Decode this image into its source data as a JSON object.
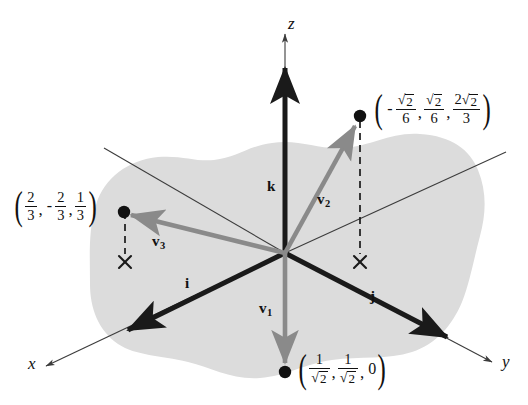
{
  "figure": {
    "type": "vector-diagram-3d",
    "background_color": "#ffffff",
    "plane_fill": "#dcdcdc",
    "basis_vector_color": "#1a1a1a",
    "vector_color": "#8a8a8a",
    "axis_color": "#3c3c3c"
  },
  "axes": [
    {
      "name": "z-axis",
      "label": "z",
      "direction": "up"
    },
    {
      "name": "x-axis",
      "label": "x",
      "direction": "lower-left"
    },
    {
      "name": "y-axis",
      "label": "y",
      "direction": "lower-right"
    }
  ],
  "basis_vectors": [
    {
      "name": "k",
      "label": "k",
      "direction": "up"
    },
    {
      "name": "i",
      "label": "i",
      "direction": "lower-left"
    },
    {
      "name": "j",
      "label": "j",
      "direction": "lower-right"
    }
  ],
  "vectors": [
    {
      "name": "v1",
      "label": "v",
      "subscript": "1",
      "direction": "down",
      "coordinates": {
        "x": "1/√2",
        "y": "1/√2",
        "z": "0"
      }
    },
    {
      "name": "v2",
      "label": "v",
      "subscript": "2",
      "direction": "upper-right",
      "coordinates": {
        "x": "-√2/6",
        "y": "√2/6",
        "z": "2√2/3"
      }
    },
    {
      "name": "v3",
      "label": "v",
      "subscript": "3",
      "direction": "left",
      "coordinates": {
        "x": "2/3",
        "y": "-2/3",
        "z": "1/3"
      }
    }
  ],
  "coordinate_labels": {
    "upper_right": {
      "name": "v2-coordinate-label",
      "components": [
        {
          "sign": "-",
          "numerator": "√2",
          "denominator": "6"
        },
        {
          "sign": "",
          "numerator": "√2",
          "denominator": "6"
        },
        {
          "sign": "",
          "numerator": "2√2",
          "denominator": "3"
        }
      ]
    },
    "left": {
      "name": "v3-coordinate-label",
      "components": [
        {
          "sign": "",
          "numerator": "2",
          "denominator": "3"
        },
        {
          "sign": "-",
          "numerator": "2",
          "denominator": "3"
        },
        {
          "sign": "",
          "numerator": "1",
          "denominator": "3"
        }
      ]
    },
    "bottom": {
      "name": "v1-coordinate-label",
      "components": [
        {
          "sign": "",
          "numerator": "1",
          "denominator": "√2"
        },
        {
          "sign": "",
          "numerator": "1",
          "denominator": "√2"
        },
        {
          "sign": "",
          "value": "0"
        }
      ]
    }
  },
  "markers": {
    "projection_mark": "×",
    "endpoint_dot": "●",
    "projection_line_style": "dashed"
  },
  "glyphs": {
    "radical": "√",
    "two": "2",
    "comma": ",",
    "minus": "−"
  }
}
